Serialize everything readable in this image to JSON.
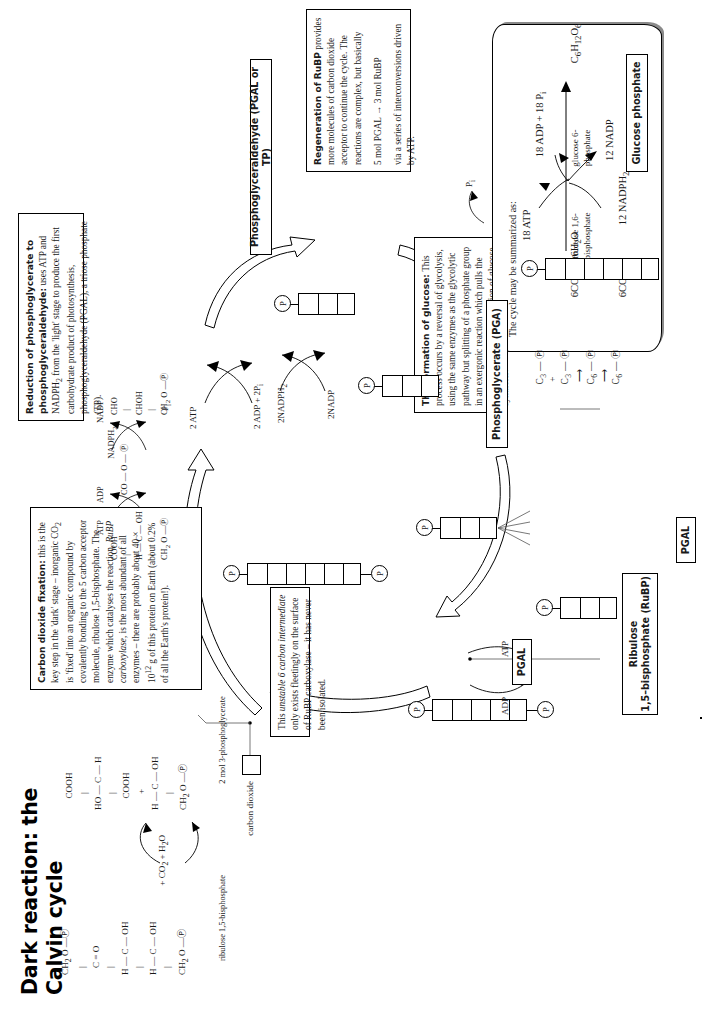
{
  "page": {
    "title_line1": "Dark reaction: the",
    "title_line2": "Calvin cycle"
  },
  "boxes": {
    "co2_fixation": {
      "heading": "Carbon dioxide fixation:",
      "body1": " this is the key step in the 'dark' stage – inorganic CO",
      "body1b": "2",
      "body1c": " is 'fixed' into an organic compound by covalently bonding to the 5 carbon acceptor molecule, ribulose 1,5-bisphosphate. The enzyme which catalyses the reaction, ",
      "ital1": "RuBP carboxylase",
      "body2": ", is the most abundant of all enzymes – there are probably about 40 × 10",
      "sup2": "12",
      "body3": " g of this protein on Earth (about 0.2% of all the Earth's protein!)."
    },
    "unstable": {
      "text1": "This ",
      "ital": "unstable 6 carbon intermediate",
      "text2": " only exists fleetingly on the surface of RuBP carboxylase – it has never been isolated."
    },
    "reduction": {
      "heading1": "Reduction of phosphoglycerate to",
      "heading2": "phosphoglyceraldehyde:",
      "body": " uses ATP and NADPH",
      "sub": "2",
      "body2": " from the 'light' stage to produce the first carbohydrate product of photosynthesis, phosphoglyceraldehyde (PGAL), a triose phosphate (TP)."
    },
    "regeneration": {
      "heading": "Regeneration of RuBP",
      "body": "provides more molecules of carbon dioxide acceptor to continue the cycle. The reactions are complex, but basically",
      "equation": "5 mol PGAL → 3 mol RuBP",
      "footer": "via a series of interconversions driven by ATP."
    },
    "glucose": {
      "heading": "The formation of glucose:",
      "body": " This process occurs by a reversal of glycolysis, using the same enzymes as the glycolytic pathway but splitting of a phosphate group in an exergonic reaction which pulls the whole sequence in the direction of glucose synthesis."
    },
    "summary": {
      "intro": "The cycle may be summarized as:",
      "left_top": "6CO",
      "left_top_sub": "2",
      "left_top_rest": "  +  6H",
      "left_top_sub2": "2",
      "left_top_rest2": "O",
      "left_bottom": "6CO",
      "left_bottom_sub": "2",
      "left_bottom_rest": "  +",
      "in_top": "18 ATP",
      "out_top": "18 ADP + 18 P",
      "out_top_sub": "i",
      "in_bottom": "12 NADPH",
      "in_bottom_sub": "2",
      "out_bottom": "12 NADP",
      "product": "C",
      "product_s1": "6",
      "product_h": "H",
      "product_s2": "12",
      "product_o": "O",
      "product_s3": "6"
    }
  },
  "labels": {
    "carbon_dioxide": "carbon dioxide",
    "rubp_line1": "Ribulose",
    "rubp_line2": "1,5–bisphosphate (RuBP)",
    "pga": "Phosphoglycerate (PGA)",
    "pgal_full": "Phosphoglyceraldehyde (PGAL or TP)",
    "pgal_1": "PGAL",
    "pgal_2": "PGAL",
    "glucose_phosphate": "Glucose phosphate",
    "ribulose_bisphosphate_caption": "ribulose 1,5-bisphosphate",
    "three_pg_caption": "2 mol 3-phosphoglycerate",
    "fructose_line1": "fructose 1,6-",
    "fructose_line2": "bisphosphate",
    "glucose6_line1": "glucose 6-",
    "glucose6_line2": "phosphate"
  },
  "cofactors": {
    "adp": "ADP",
    "atp": "ATP",
    "two_atp": "2 ATP",
    "two_adp_2pi": "2 ADP + 2P",
    "two_adp_2pi_sub": "i",
    "two_nadph": "2NADPH",
    "two_nadph_sub": "2",
    "two_nadp": "2NADP",
    "atp2": "ATP",
    "adp2": "ADP",
    "nadph2": "NADPH",
    "nadph2_sub": "2",
    "nadp2": "NADP",
    "pi": "P",
    "pi_sub": "i",
    "pi_small": "P",
    "pi_small_sub": "i"
  },
  "molecules": {
    "rubp_structure": [
      "CH",
      "2",
      " O — Ⓟ",
      "C",
      "O",
      "H — C — OH",
      "H — C — OH",
      "CH",
      "2",
      " O — Ⓟ"
    ],
    "pga_left": [
      "CH",
      "2",
      "O — Ⓟ"
    ],
    "pga_right": [
      "COOH",
      "HO — C — H",
      "COOH",
      "H — C — OH",
      "CH",
      "2",
      "O — Ⓟ"
    ],
    "co2_water": "+ CO",
    "co2_water_sub": "2",
    "co2_water_rest": " + H",
    "co2_water_sub2": "2",
    "co2_water_rest2": "O",
    "pga_mol_1": "COOH",
    "pga_mol_2": "H — C — OH",
    "pga_mol_3": "CH",
    "pga_mol_3s": "2",
    "pga_mol_3r": " O — Ⓟ",
    "tp_mol_1": "CHO",
    "tp_mol_2": "CHOH",
    "tp_mol_3": "CH",
    "tp_mol_3s": "2",
    "tp_mol_3r": " O — Ⓟ",
    "co_o_p": "CO — O — Ⓟ",
    "glycolysis": "C₃ — Ⓟ  +  C₃ — Ⓟ  ⟶  C₆ — Ⓟ  ⟶  C₆ — Ⓟ"
  },
  "glycolysis_row": {
    "c3a": "C",
    "c3a_sub": "3",
    "p1": "Ⓟ",
    "plus": "+",
    "c3b": "C",
    "c3b_sub": "3",
    "p2": "Ⓟ",
    "c6a": "C",
    "c6a_sub": "6",
    "p3": "Ⓟ",
    "c6b": "C",
    "c6b_sub": "6",
    "p4": "Ⓟ"
  },
  "colors": {
    "ink": "#000000",
    "line": "#1a1a1a",
    "shadow": "#8a8a8a",
    "paper": "#ffffff"
  }
}
